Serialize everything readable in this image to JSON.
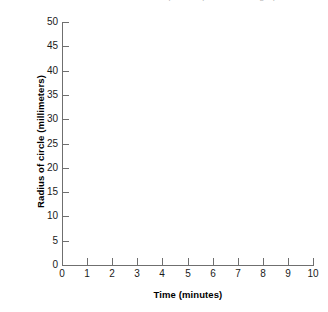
{
  "caption_fragment": "follow the directions below to plot the points on the graph",
  "chart_data": {
    "type": "scatter",
    "title": "",
    "subtitle": "",
    "xlabel": "Time (minutes)",
    "ylabel": "Radius of circle (millimeters)",
    "xlim": [
      0,
      10
    ],
    "ylim": [
      0,
      50
    ],
    "xticks": [
      0,
      1,
      2,
      3,
      4,
      5,
      6,
      7,
      8,
      9,
      10
    ],
    "yticks": [
      0,
      5,
      10,
      15,
      20,
      25,
      30,
      35,
      40,
      45,
      50
    ],
    "xtick_labels": [
      "0",
      "1",
      "2",
      "3",
      "4",
      "5",
      "6",
      "7",
      "8",
      "9",
      "10"
    ],
    "ytick_labels": [
      "0",
      "5",
      "10",
      "15",
      "20",
      "25",
      "30",
      "35",
      "40",
      "45",
      "50"
    ],
    "grid": false,
    "legend": null,
    "series": [],
    "values": [],
    "x": [],
    "annotations": [],
    "note": "Empty plotting grid — no data points, lines, or bars are drawn in the plot area.",
    "colors": {
      "axis": "#6f6f6f",
      "text": "#1a1a1a",
      "title": "#000000",
      "background": "#ffffff"
    }
  }
}
